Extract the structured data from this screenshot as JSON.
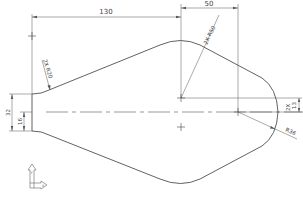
{
  "drawing": {
    "type": "2D CAD sketch",
    "colors": {
      "line": "#3a3a3a",
      "dim": "#555555",
      "background": "#ffffff"
    },
    "dimensions": {
      "horizontal_130": "130",
      "horizontal_50": "50",
      "radius_upper_right": "2X R50",
      "radius_upper_left": "2X R20",
      "height_32": "32",
      "height_16": "16",
      "offset_13": "2X 13",
      "offset_13_prefix": "2X",
      "offset_13_value": "13",
      "radius_right": "R36"
    },
    "axis_triad": {
      "x_label": "X",
      "y_label": "Y"
    }
  }
}
